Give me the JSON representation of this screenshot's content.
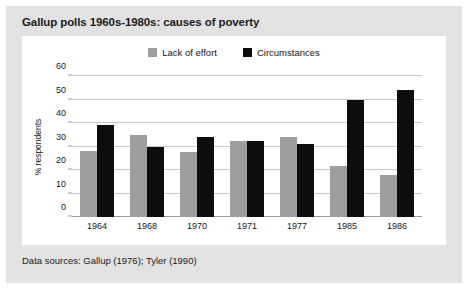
{
  "figure": {
    "title": "Gallup polls 1960s-1980s: causes of poverty",
    "footer": "Data sources: Gallup (1976); Tyler (1990)",
    "panel_bg": "#e2e2e2",
    "plot_bg": "#ffffff"
  },
  "chart_data": {
    "type": "bar",
    "title": "Gallup polls 1960s-1980s: causes of poverty",
    "xlabel": "",
    "ylabel": "% respondents",
    "ylim": [
      0,
      60
    ],
    "yticks": [
      0,
      10,
      20,
      30,
      40,
      50,
      60
    ],
    "grid": true,
    "legend_position": "top-center",
    "categories": [
      "1964",
      "1968",
      "1970",
      "1971",
      "1977",
      "1985",
      "1986"
    ],
    "series": [
      {
        "name": "Lack of effort",
        "color": "#9e9e9e",
        "values": [
          28,
          35,
          27.5,
          32.5,
          34,
          21.5,
          18
        ]
      },
      {
        "name": "Circumstances",
        "color": "#0d0d0d",
        "values": [
          39,
          30,
          34,
          32.5,
          31,
          50,
          54
        ]
      }
    ],
    "annotations": [
      "Data sources: Gallup (1976); Tyler (1990)"
    ]
  }
}
